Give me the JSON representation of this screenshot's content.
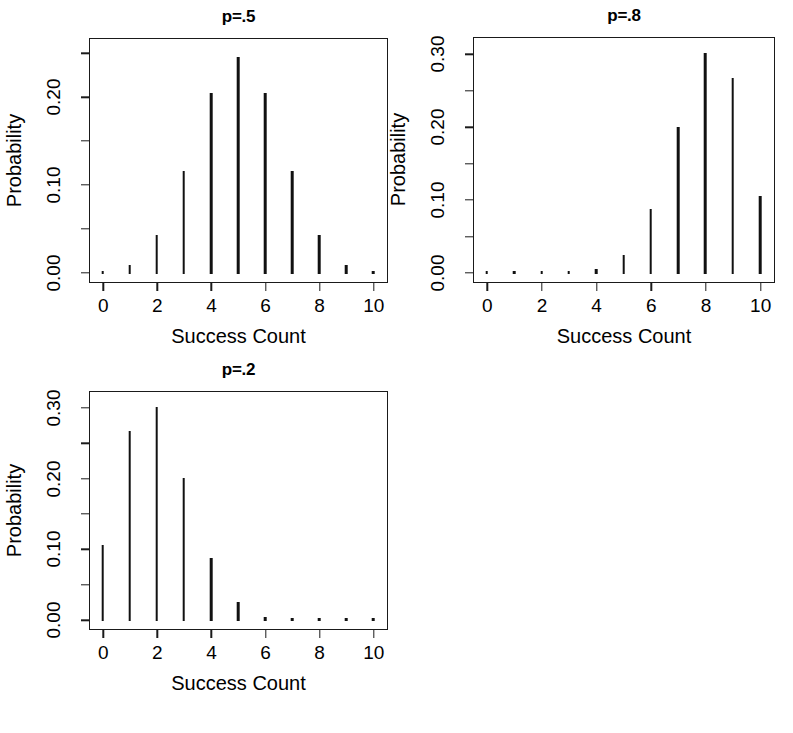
{
  "figure": {
    "background": "#ffffff",
    "ink": "#111111",
    "axis_title_x": "Success Count",
    "axis_title_y": "Probability"
  },
  "chart_data": [
    {
      "type": "bar",
      "title": "p=.5",
      "xlabel": "Success Count",
      "ylabel": "Probability",
      "categories": [
        0,
        1,
        2,
        3,
        4,
        5,
        6,
        7,
        8,
        9,
        10
      ],
      "values": [
        0.001,
        0.01,
        0.044,
        0.117,
        0.205,
        0.246,
        0.205,
        0.117,
        0.044,
        0.01,
        0.001
      ],
      "xlim": [
        0,
        10
      ],
      "ylim": [
        0,
        0.26
      ],
      "xticks": [
        0,
        2,
        4,
        6,
        8,
        10
      ],
      "xticklabels": [
        "0",
        "2",
        "4",
        "6",
        "8",
        "10"
      ],
      "yticks": [
        0.0,
        0.05,
        0.1,
        0.15,
        0.2,
        0.25
      ],
      "yticklabels": [
        "0.00",
        "",
        "0.10",
        "",
        "0.20",
        ""
      ],
      "grid": false,
      "legend": "none"
    },
    {
      "type": "bar",
      "title": "p=.8",
      "xlabel": "Success Count",
      "ylabel": "Probability",
      "categories": [
        0,
        1,
        2,
        3,
        4,
        5,
        6,
        7,
        8,
        9,
        10
      ],
      "values": [
        0.0,
        0.0,
        0.0,
        0.001,
        0.006,
        0.026,
        0.088,
        0.201,
        0.302,
        0.268,
        0.107
      ],
      "xlim": [
        0,
        10
      ],
      "ylim": [
        0,
        0.315
      ],
      "xticks": [
        0,
        2,
        4,
        6,
        8,
        10
      ],
      "xticklabels": [
        "0",
        "2",
        "4",
        "6",
        "8",
        "10"
      ],
      "yticks": [
        0.0,
        0.05,
        0.1,
        0.15,
        0.2,
        0.25,
        0.3
      ],
      "yticklabels": [
        "0.00",
        "",
        "0.10",
        "",
        "0.20",
        "",
        "0.30"
      ],
      "grid": false,
      "legend": "none"
    },
    {
      "type": "bar",
      "title": "p=.2",
      "xlabel": "Success Count",
      "ylabel": "Probability",
      "categories": [
        0,
        1,
        2,
        3,
        4,
        5,
        6,
        7,
        8,
        9,
        10
      ],
      "values": [
        0.107,
        0.268,
        0.302,
        0.201,
        0.088,
        0.026,
        0.006,
        0.001,
        0.0,
        0.0,
        0.0
      ],
      "xlim": [
        0,
        10
      ],
      "ylim": [
        0,
        0.315
      ],
      "xticks": [
        0,
        2,
        4,
        6,
        8,
        10
      ],
      "xticklabels": [
        "0",
        "2",
        "4",
        "6",
        "8",
        "10"
      ],
      "yticks": [
        0.0,
        0.05,
        0.1,
        0.15,
        0.2,
        0.25,
        0.3
      ],
      "yticklabels": [
        "0.00",
        "",
        "0.10",
        "",
        "0.20",
        "",
        "0.30"
      ],
      "grid": false,
      "legend": "none"
    }
  ],
  "panels": [
    {
      "id": "panel-p5",
      "title": "p=.5",
      "box": {
        "left": 89,
        "top": 38,
        "width": 299,
        "height": 245
      }
    },
    {
      "id": "panel-p8",
      "title": "p=.8",
      "box": {
        "left": 473,
        "top": 37,
        "width": 302,
        "height": 246
      }
    },
    {
      "id": "panel-p2",
      "title": "p=.2",
      "box": {
        "left": 89,
        "top": 391,
        "width": 299,
        "height": 239
      }
    }
  ]
}
